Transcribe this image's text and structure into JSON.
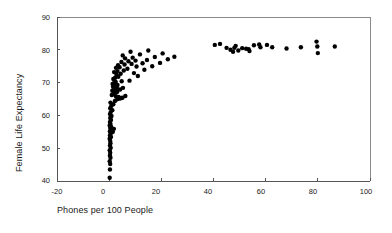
{
  "chart_data": {
    "type": "scatter",
    "title": "",
    "xlabel": "Phones per 100 People",
    "ylabel": "Female Life Expectancy",
    "xlim": [
      -20,
      100
    ],
    "ylim": [
      40,
      90
    ],
    "xticks": [
      -20,
      0,
      20,
      40,
      60,
      80,
      100
    ],
    "yticks": [
      40,
      50,
      60,
      70,
      80,
      90
    ],
    "xtick_labels": [
      "-20",
      "0",
      "20",
      "40",
      "60",
      "80",
      "100"
    ],
    "ytick_labels": [
      "40",
      "50",
      "60",
      "70",
      "80",
      "90"
    ],
    "grid": false,
    "legend": null,
    "marker": "filled-circle",
    "marker_color": "#000000",
    "marker_size": 2.2,
    "series": [
      {
        "name": "Countries",
        "points": [
          [
            0.2,
            41.0
          ],
          [
            0.3,
            43.5
          ],
          [
            0.4,
            45.2
          ],
          [
            0.2,
            46.0
          ],
          [
            0.5,
            47.1
          ],
          [
            0.3,
            47.8
          ],
          [
            0.4,
            48.6
          ],
          [
            0.2,
            49.4
          ],
          [
            0.6,
            50.1
          ],
          [
            0.3,
            50.8
          ],
          [
            0.5,
            51.5
          ],
          [
            0.4,
            52.2
          ],
          [
            0.2,
            52.9
          ],
          [
            0.7,
            53.4
          ],
          [
            0.3,
            53.9
          ],
          [
            0.5,
            54.4
          ],
          [
            0.9,
            54.8
          ],
          [
            1.4,
            55.0
          ],
          [
            0.3,
            55.2
          ],
          [
            0.6,
            55.5
          ],
          [
            1.1,
            55.7
          ],
          [
            1.8,
            55.9
          ],
          [
            0.4,
            56.2
          ],
          [
            0.8,
            56.5
          ],
          [
            0.2,
            56.9
          ],
          [
            0.5,
            57.4
          ],
          [
            0.3,
            58.0
          ],
          [
            0.7,
            58.6
          ],
          [
            0.4,
            59.2
          ],
          [
            0.9,
            59.8
          ],
          [
            0.3,
            60.4
          ],
          [
            0.6,
            61.0
          ],
          [
            1.2,
            61.6
          ],
          [
            0.4,
            62.2
          ],
          [
            0.8,
            62.9
          ],
          [
            1.6,
            63.4
          ],
          [
            0.5,
            63.9
          ],
          [
            2.2,
            64.4
          ],
          [
            3.1,
            64.9
          ],
          [
            4.0,
            65.1
          ],
          [
            4.6,
            65.3
          ],
          [
            5.1,
            65.4
          ],
          [
            3.6,
            65.6
          ],
          [
            2.6,
            65.8
          ],
          [
            6.2,
            65.9
          ],
          [
            1.0,
            66.2
          ],
          [
            1.6,
            66.5
          ],
          [
            2.1,
            66.8
          ],
          [
            2.6,
            67.0
          ],
          [
            3.1,
            67.2
          ],
          [
            1.2,
            67.5
          ],
          [
            1.8,
            67.7
          ],
          [
            4.2,
            67.9
          ],
          [
            2.4,
            68.1
          ],
          [
            3.0,
            68.3
          ],
          [
            5.3,
            68.4
          ],
          [
            1.5,
            68.7
          ],
          [
            2.0,
            68.9
          ],
          [
            2.6,
            69.1
          ],
          [
            3.2,
            69.3
          ],
          [
            1.3,
            69.6
          ],
          [
            1.9,
            69.9
          ],
          [
            2.5,
            70.2
          ],
          [
            4.8,
            70.4
          ],
          [
            7.8,
            70.6
          ],
          [
            1.6,
            71.1
          ],
          [
            2.3,
            71.5
          ],
          [
            3.5,
            71.8
          ],
          [
            11.0,
            72.0
          ],
          [
            2.8,
            72.4
          ],
          [
            4.4,
            72.7
          ],
          [
            9.5,
            72.9
          ],
          [
            1.9,
            73.2
          ],
          [
            3.2,
            73.5
          ],
          [
            5.6,
            73.7
          ],
          [
            13.5,
            73.9
          ],
          [
            7.0,
            74.2
          ],
          [
            2.6,
            74.5
          ],
          [
            4.0,
            74.7
          ],
          [
            10.5,
            74.9
          ],
          [
            16.5,
            75.0
          ],
          [
            3.4,
            75.3
          ],
          [
            5.9,
            75.5
          ],
          [
            8.6,
            75.7
          ],
          [
            12.8,
            75.9
          ],
          [
            19.5,
            76.0
          ],
          [
            4.7,
            76.3
          ],
          [
            7.4,
            76.5
          ],
          [
            10.1,
            76.7
          ],
          [
            14.5,
            76.9
          ],
          [
            22.5,
            77.1
          ],
          [
            6.1,
            77.4
          ],
          [
            9.0,
            77.6
          ],
          [
            17.5,
            77.8
          ],
          [
            25.0,
            77.9
          ],
          [
            5.2,
            78.3
          ],
          [
            11.8,
            78.6
          ],
          [
            20.5,
            78.9
          ],
          [
            8.2,
            79.4
          ],
          [
            15.0,
            79.8
          ],
          [
            40.5,
            81.5
          ],
          [
            42.5,
            81.8
          ],
          [
            45.0,
            80.6
          ],
          [
            46.5,
            80.0
          ],
          [
            47.5,
            79.4
          ],
          [
            48.0,
            80.6
          ],
          [
            48.5,
            81.2
          ],
          [
            49.5,
            79.8
          ],
          [
            51.0,
            80.5
          ],
          [
            52.5,
            80.3
          ],
          [
            53.5,
            80.2
          ],
          [
            53.8,
            79.6
          ],
          [
            55.5,
            81.4
          ],
          [
            57.5,
            81.6
          ],
          [
            58.0,
            80.8
          ],
          [
            60.5,
            81.5
          ],
          [
            62.5,
            80.8
          ],
          [
            68.0,
            80.4
          ],
          [
            73.5,
            80.8
          ],
          [
            79.5,
            82.5
          ],
          [
            79.8,
            81.0
          ],
          [
            80.0,
            79.0
          ],
          [
            86.5,
            81.0
          ]
        ]
      }
    ]
  },
  "axes": {
    "ylabel": "Female Life Expectancy",
    "xlabel": "Phones per 100 People"
  }
}
